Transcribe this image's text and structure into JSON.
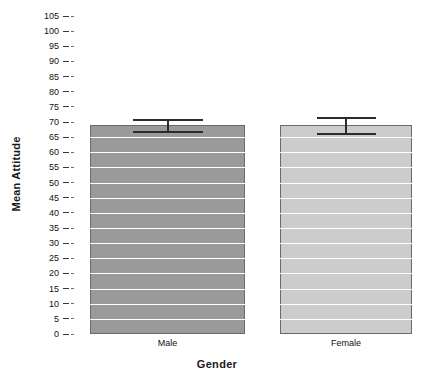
{
  "chart_data": {
    "type": "bar",
    "title": "",
    "xlabel": "Gender",
    "ylabel": "Mean Attitude",
    "categories": [
      "Male",
      "Female"
    ],
    "values": [
      69,
      69
    ],
    "errors": [
      2.0,
      2.5
    ],
    "error_type": "error-bar",
    "ylim": [
      0,
      105
    ],
    "ytick_step": 5,
    "yticks": [
      0,
      5,
      10,
      15,
      20,
      25,
      30,
      35,
      40,
      45,
      50,
      55,
      60,
      65,
      70,
      75,
      80,
      85,
      90,
      95,
      100,
      105
    ],
    "ytick_labels": [
      "0",
      "5",
      "10",
      "15",
      "20",
      "25",
      "30",
      "35",
      "40",
      "45",
      "50",
      "55",
      "60",
      "65",
      "70",
      "75",
      "80",
      "85",
      "90",
      "95",
      "100",
      "105"
    ],
    "grid": true,
    "grid_color": "#ffffff",
    "legend": false,
    "bar_colors": [
      "#9a9a9a",
      "#cccccc"
    ],
    "bar_border_color": "#6a6a6a",
    "error_bar_color": "#2b2b2b",
    "background": "#ffffff"
  },
  "axis": {
    "y_title": "Mean Attitude",
    "x_title": "Gender"
  }
}
